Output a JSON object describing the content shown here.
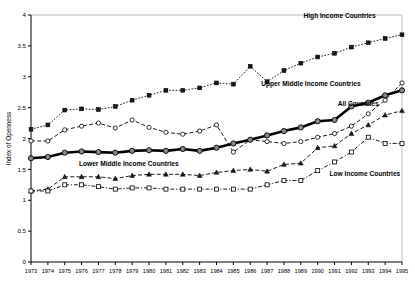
{
  "chart_data": {
    "type": "line",
    "title": "",
    "xlabel": "",
    "ylabel": "Index of Openness",
    "xlim": [
      1973,
      1995
    ],
    "ylim": [
      0,
      4
    ],
    "yticks": [
      "0",
      "0.5",
      "1",
      "1.5",
      "2",
      "2.5",
      "3",
      "3.5",
      "4"
    ],
    "ytick_values": [
      0,
      0.5,
      1,
      1.5,
      2,
      2.5,
      3,
      3.5,
      4
    ],
    "grid": false,
    "legend_position": "inline-annotations",
    "x": [
      1973,
      1974,
      1975,
      1976,
      1977,
      1978,
      1979,
      1980,
      1981,
      1982,
      1983,
      1984,
      1985,
      1986,
      1987,
      1988,
      1989,
      1990,
      1991,
      1992,
      1993,
      1994,
      1995
    ],
    "xtick_labels": [
      "1973",
      "1974",
      "1975",
      "1976",
      "1977",
      "1978",
      "1979",
      "1980",
      "1981",
      "1982",
      "1983",
      "1984",
      "1985",
      "1986",
      "1987",
      "1988",
      "1989",
      "1990",
      "1991",
      "1992",
      "1993",
      "1994",
      "1995"
    ],
    "series": [
      {
        "name": "High Income Countries",
        "marker": "filled-square",
        "line_style": "dotted",
        "color": "#000000",
        "values": [
          2.15,
          2.22,
          2.46,
          2.48,
          2.47,
          2.52,
          2.62,
          2.7,
          2.78,
          2.78,
          2.82,
          2.9,
          2.88,
          3.17,
          2.92,
          3.1,
          3.22,
          3.32,
          3.38,
          3.48,
          3.55,
          3.62,
          3.68
        ]
      },
      {
        "name": "Upper Middle Income Countries",
        "marker": "open-circle",
        "line_style": "dashed",
        "color": "#000000",
        "values": [
          1.96,
          1.96,
          2.14,
          2.2,
          2.25,
          2.17,
          2.3,
          2.18,
          2.1,
          2.07,
          2.12,
          2.22,
          1.78,
          1.98,
          1.95,
          1.92,
          1.95,
          2.02,
          2.08,
          2.2,
          2.4,
          2.62,
          2.9
        ]
      },
      {
        "name": "All Countries",
        "marker": "gray-circle",
        "line_style": "solid-thick",
        "color": "#000000",
        "values": [
          1.68,
          1.7,
          1.77,
          1.79,
          1.78,
          1.77,
          1.8,
          1.81,
          1.8,
          1.83,
          1.8,
          1.85,
          1.92,
          1.98,
          2.05,
          2.12,
          2.18,
          2.28,
          2.3,
          2.52,
          2.58,
          2.7,
          2.78
        ]
      },
      {
        "name": "Lower Middle Income Countries",
        "marker": "filled-triangle",
        "line_style": "dashed",
        "color": "#000000",
        "values": [
          1.15,
          1.18,
          1.38,
          1.38,
          1.38,
          1.35,
          1.4,
          1.42,
          1.42,
          1.42,
          1.4,
          1.45,
          1.48,
          1.5,
          1.47,
          1.58,
          1.6,
          1.85,
          1.88,
          2.08,
          2.22,
          2.38,
          2.45
        ]
      },
      {
        "name": "Low Income Countries",
        "marker": "open-square",
        "line_style": "dash-dot",
        "color": "#000000",
        "values": [
          1.15,
          1.15,
          1.25,
          1.25,
          1.22,
          1.18,
          1.2,
          1.2,
          1.18,
          1.18,
          1.18,
          1.18,
          1.18,
          1.18,
          1.25,
          1.32,
          1.32,
          1.48,
          1.62,
          1.78,
          2.02,
          1.92,
          1.92
        ]
      }
    ],
    "annotations": [
      {
        "text": "High Income Countries",
        "x": 1991.3,
        "y": 3.95,
        "anchor": "middle"
      },
      {
        "text": "Upper Middle Income Countries",
        "x": 1989.6,
        "y": 2.85,
        "anchor": "middle"
      },
      {
        "text": "All Countries",
        "x": 1992.4,
        "y": 2.52,
        "anchor": "middle"
      },
      {
        "text": "Lower Middle Income Countries",
        "x": 1978.8,
        "y": 1.55,
        "anchor": "middle"
      },
      {
        "text": "Low Income Countries",
        "x": 1992.8,
        "y": 1.4,
        "anchor": "middle"
      }
    ]
  }
}
